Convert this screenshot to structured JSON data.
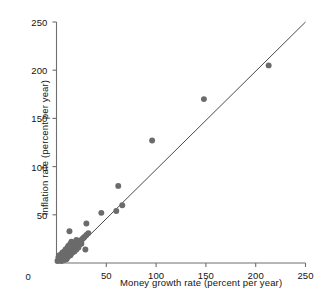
{
  "chart_data": {
    "type": "scatter",
    "title": "",
    "xlabel": "Money growth rate (percent per year)",
    "ylabel": "Inflation rate (percent per year)",
    "xlim": [
      0,
      250
    ],
    "ylim": [
      0,
      250
    ],
    "xticks": [
      0,
      50,
      100,
      150,
      200,
      250
    ],
    "yticks": [
      0,
      50,
      100,
      150,
      200,
      250
    ],
    "xtick_labels": [
      "0",
      "50",
      "100",
      "150",
      "200",
      "250"
    ],
    "ytick_labels": [
      "0",
      "50",
      "100",
      "150",
      "200",
      "250"
    ],
    "grid": false,
    "legend": "none",
    "marker_color": "#6b6b6b",
    "marker_size": 4.6,
    "axis_color": "#6e6e6e",
    "trendline": {
      "name": "45-degree reference line",
      "color": "#4a4a4a",
      "x0": 5,
      "y0": 0,
      "x1": 250,
      "y1": 250
    },
    "series": [
      {
        "name": "Countries",
        "points": [
          [
            1,
            2
          ],
          [
            2,
            3
          ],
          [
            2,
            6
          ],
          [
            3,
            4
          ],
          [
            3,
            8
          ],
          [
            4,
            3
          ],
          [
            4,
            7
          ],
          [
            5,
            5
          ],
          [
            5,
            9
          ],
          [
            5,
            2
          ],
          [
            6,
            6
          ],
          [
            6,
            11
          ],
          [
            7,
            4
          ],
          [
            7,
            8
          ],
          [
            8,
            7
          ],
          [
            8,
            12
          ],
          [
            8,
            3
          ],
          [
            9,
            9
          ],
          [
            9,
            5
          ],
          [
            9,
            14
          ],
          [
            10,
            8
          ],
          [
            10,
            12
          ],
          [
            10,
            4
          ],
          [
            11,
            10
          ],
          [
            11,
            16
          ],
          [
            11,
            6
          ],
          [
            12,
            11
          ],
          [
            12,
            7
          ],
          [
            12,
            18
          ],
          [
            13,
            13
          ],
          [
            13,
            9
          ],
          [
            13,
            33
          ],
          [
            14,
            12
          ],
          [
            14,
            20
          ],
          [
            14,
            8
          ],
          [
            15,
            14
          ],
          [
            15,
            10
          ],
          [
            15,
            22
          ],
          [
            16,
            15
          ],
          [
            16,
            11
          ],
          [
            16,
            19
          ],
          [
            17,
            16
          ],
          [
            17,
            13
          ],
          [
            18,
            17
          ],
          [
            18,
            12
          ],
          [
            18,
            21
          ],
          [
            19,
            18
          ],
          [
            19,
            15
          ],
          [
            20,
            19
          ],
          [
            20,
            14
          ],
          [
            20,
            24
          ],
          [
            21,
            20
          ],
          [
            21,
            17
          ],
          [
            22,
            21
          ],
          [
            22,
            16
          ],
          [
            23,
            22
          ],
          [
            23,
            19
          ],
          [
            24,
            23
          ],
          [
            25,
            24
          ],
          [
            25,
            20
          ],
          [
            26,
            25
          ],
          [
            27,
            26
          ],
          [
            28,
            27
          ],
          [
            29,
            14
          ],
          [
            30,
            29
          ],
          [
            30,
            41
          ],
          [
            32,
            31
          ],
          [
            45,
            52
          ],
          [
            60,
            54
          ],
          [
            62,
            80
          ],
          [
            66,
            60
          ],
          [
            96,
            127
          ],
          [
            148,
            170
          ],
          [
            213,
            205
          ]
        ]
      }
    ]
  },
  "figure": {
    "caption_faint": ""
  }
}
